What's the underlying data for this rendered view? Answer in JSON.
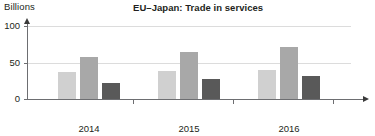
{
  "chart_data": {
    "type": "bar",
    "title": "EU–Japan: Trade in services",
    "xlabel": "Years",
    "ylabel": "Billions",
    "categories": [
      "2014",
      "2015",
      "2016"
    ],
    "series": [
      {
        "name": "series-1",
        "color": "#d0d0d0",
        "values": [
          37,
          38,
          40
        ]
      },
      {
        "name": "series-2",
        "color": "#a8a8a8",
        "values": [
          58,
          65,
          71
        ]
      },
      {
        "name": "series-3",
        "color": "#595959",
        "values": [
          22,
          27,
          31
        ]
      }
    ],
    "ylim": [
      0,
      100
    ],
    "yticks": [
      0,
      50,
      100
    ],
    "ytick_labels": [
      "0",
      "50",
      "100"
    ],
    "grid": true,
    "legend": "none",
    "axis_arrows": true
  },
  "axis": {
    "y_unit_caption": "Billions",
    "x_title": "Years",
    "y_tick_0": "0",
    "y_tick_50": "50",
    "y_tick_100": "100"
  },
  "colors": {
    "axis": "#6d6e71",
    "gridline": "#dcdcdc",
    "text": "#231f20",
    "bar_light": "#d0d0d0",
    "bar_medium": "#a8a8a8",
    "bar_dark": "#595959",
    "background": "#ffffff"
  }
}
